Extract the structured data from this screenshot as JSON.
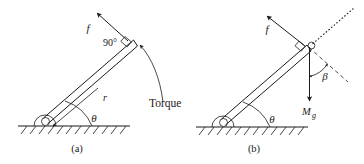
{
  "figure": {
    "background_color": "#ffffff",
    "ink_color": "#1a1a1a",
    "panels": [
      {
        "id": "a",
        "caption": "(a)",
        "labels": {
          "force": "f",
          "radius": "r",
          "angle_ground": "θ",
          "right_angle": "90°",
          "torque": "Torque"
        },
        "elements": [
          "ground-line",
          "ground-hatching",
          "hinge",
          "rod",
          "force-arrow",
          "radius-arrow",
          "theta-arc",
          "right-angle-mark",
          "torque-curved-arrow"
        ]
      },
      {
        "id": "b",
        "caption": "(b)",
        "labels": {
          "force": "f",
          "weight": "M",
          "weight_subscript": "g",
          "angle_ground": "θ",
          "angle_beta": "β"
        },
        "elements": [
          "ground-line",
          "ground-hatching",
          "hinge",
          "rod",
          "force-arrow",
          "weight-arrow",
          "theta-arc",
          "beta-arc",
          "right-angle-mark",
          "rod-extension-dotted-line",
          "perpendicular-dashed-line"
        ]
      }
    ]
  }
}
